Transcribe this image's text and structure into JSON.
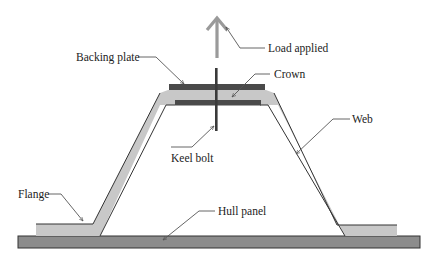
{
  "figure": {
    "type": "cross-section schematic"
  },
  "labels": {
    "load_applied": "Load applied",
    "backing_plate": "Backing plate",
    "crown": "Crown",
    "keel_bolt": "Keel bolt",
    "web": "Web",
    "flange": "Flange",
    "hull_panel": "Hull panel"
  },
  "colors": {
    "hull_panel": "#8c8c8c",
    "stiffener": "#c8c8c8",
    "plate": "#4a4a4a",
    "bolt": "#3a3a3a",
    "load_arrow": "#9a9a9a",
    "outline": "#333333",
    "leader": "#555555"
  }
}
